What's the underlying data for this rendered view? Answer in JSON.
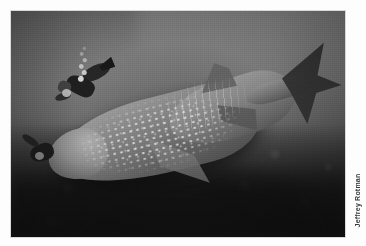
{
  "page": {
    "background_color": "#fdfdfd",
    "width": 366,
    "height": 246
  },
  "photo": {
    "alt_title": "Whale shark swimming past scuba divers over a reef",
    "subject": "whale shark",
    "color_mode": "grayscale",
    "frame": {
      "left": 11,
      "top": 11,
      "width": 334,
      "height": 226
    },
    "colors": {
      "water_light": "#7d8180",
      "water_mid": "#5e6261",
      "water_dark": "#2b2e2e",
      "shark_light": "#a0a5a2",
      "shark_mid": "#767b79",
      "shark_dark": "#474b4a",
      "tail_dark": "#2e3231",
      "spot_white": "#ecebec",
      "diver_black": "#1d2020",
      "seabed_dark": "#1a1d1c"
    },
    "elements": [
      {
        "name": "whale-shark",
        "description": "large spotted whale shark, head lower-left, tail upper-right"
      },
      {
        "name": "caudal-fin",
        "description": "dark crescent tail fin at upper right"
      },
      {
        "name": "dorsal-fin",
        "description": "dorsal fin on mid-upper back"
      },
      {
        "name": "pectoral-fin",
        "description": "pectoral fin below mid body"
      },
      {
        "name": "diver-upper-left",
        "description": "scuba diver in black wetsuit with exhaust bubbles rising"
      },
      {
        "name": "diver-lower-left",
        "description": "second diver silhouette near reef"
      },
      {
        "name": "reef-seabed",
        "description": "dark textured coral reef floor across lower half"
      },
      {
        "name": "light-shaft",
        "description": "lighter vertical column of water in upper portion"
      }
    ]
  },
  "credit": {
    "text": "Jeffrey Rotman",
    "orientation": "vertical-rotated-90-ccw",
    "color": "#3a3a3a"
  }
}
